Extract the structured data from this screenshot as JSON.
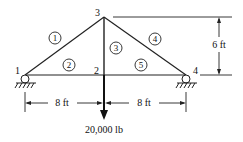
{
  "diagram": {
    "nodes": [
      {
        "id": "1",
        "label": "1"
      },
      {
        "id": "2",
        "label": "2"
      },
      {
        "id": "3",
        "label": "3"
      },
      {
        "id": "4",
        "label": "4"
      }
    ],
    "members": [
      {
        "id": "1",
        "label": "1",
        "from": "1",
        "to": "3"
      },
      {
        "id": "2",
        "label": "2",
        "from": "1",
        "to": "2"
      },
      {
        "id": "3",
        "label": "3",
        "from": "2",
        "to": "3"
      },
      {
        "id": "4",
        "label": "4",
        "from": "3",
        "to": "4"
      },
      {
        "id": "5",
        "label": "5",
        "from": "2",
        "to": "4"
      }
    ],
    "dimensions": {
      "left_span": "8 ft",
      "right_span": "8 ft",
      "height": "6 ft"
    },
    "load": {
      "label": "20,000 lb",
      "node": "2",
      "direction": "down"
    },
    "supports": [
      {
        "node": "1",
        "type": "roller"
      },
      {
        "node": "4",
        "type": "roller"
      }
    ]
  }
}
